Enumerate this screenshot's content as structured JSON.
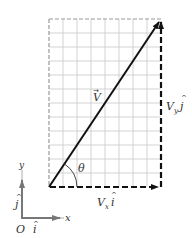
{
  "diagram": {
    "grid": {
      "columns": 8,
      "rows": 12,
      "color": "#c8c8c8"
    },
    "vector": {
      "label": "V",
      "arrow": "→"
    },
    "components": {
      "x": {
        "label_main": "V",
        "label_sub": "x",
        "label_unit": "i",
        "hat": "^"
      },
      "y": {
        "label_main": "V",
        "label_sub": "y",
        "label_unit": "j",
        "hat": "^"
      }
    },
    "angle": {
      "label": "θ"
    },
    "axes": {
      "x_label": "x",
      "y_label": "y",
      "origin_label": "O",
      "i_label": "i",
      "j_label": "j",
      "hat": "^",
      "color": "#777777"
    },
    "colors": {
      "vector": "#111111",
      "dashed": "#111111",
      "grid": "#c8c8c8"
    }
  }
}
